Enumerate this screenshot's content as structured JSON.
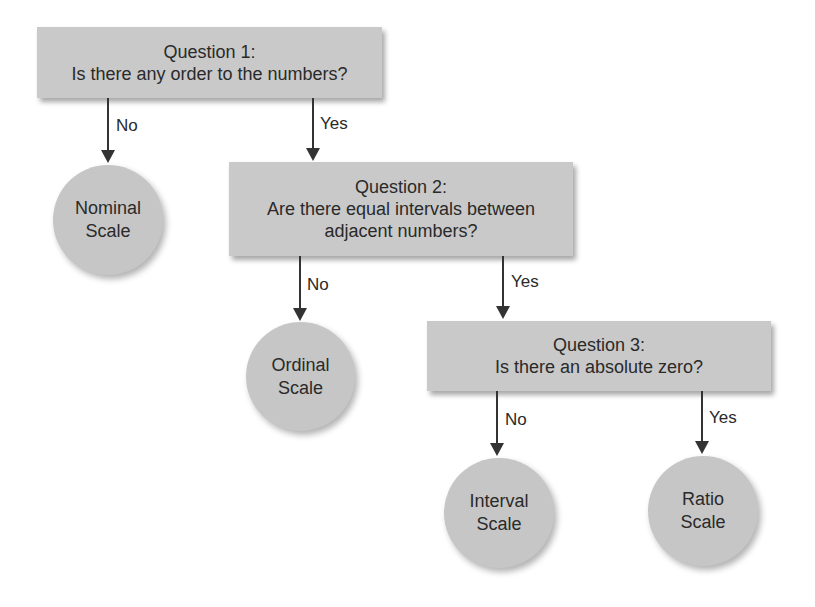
{
  "diagram": {
    "type": "flowchart",
    "questions": [
      {
        "id": "q1",
        "title": "Question 1:",
        "text": "Is there any order to the numbers?"
      },
      {
        "id": "q2",
        "title": "Question 2:",
        "text_line1": "Are there equal intervals between",
        "text_line2": "adjacent numbers?"
      },
      {
        "id": "q3",
        "title": "Question 3:",
        "text": "Is there an absolute zero?"
      }
    ],
    "outcomes": [
      {
        "id": "nominal",
        "line1": "Nominal",
        "line2": "Scale"
      },
      {
        "id": "ordinal",
        "line1": "Ordinal",
        "line2": "Scale"
      },
      {
        "id": "interval",
        "line1": "Interval",
        "line2": "Scale"
      },
      {
        "id": "ratio",
        "line1": "Ratio",
        "line2": "Scale"
      }
    ],
    "edges": [
      {
        "from": "q1",
        "to": "nominal",
        "label": "No"
      },
      {
        "from": "q1",
        "to": "q2",
        "label": "Yes"
      },
      {
        "from": "q2",
        "to": "ordinal",
        "label": "No"
      },
      {
        "from": "q2",
        "to": "q3",
        "label": "Yes"
      },
      {
        "from": "q3",
        "to": "interval",
        "label": "No"
      },
      {
        "from": "q3",
        "to": "ratio",
        "label": "Yes"
      }
    ],
    "colors": {
      "box_fill": "#c9c9c9",
      "circle_fill": "#c6c6c6",
      "arrow": "#333333",
      "text": "#2a2a2a"
    }
  }
}
